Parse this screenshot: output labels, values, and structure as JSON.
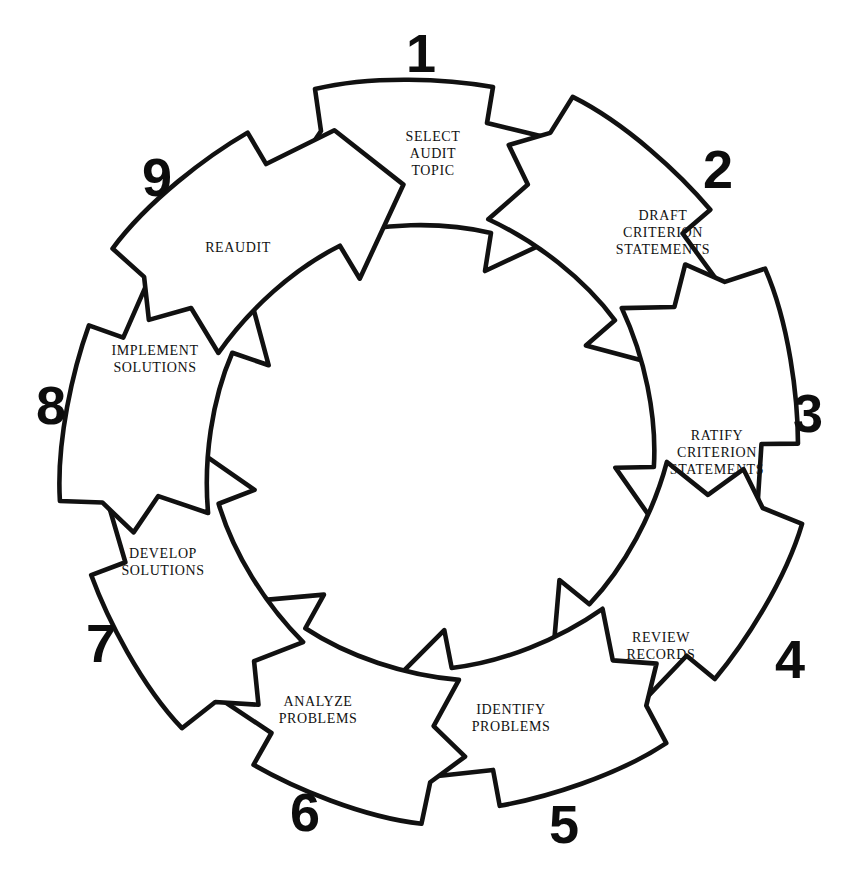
{
  "diagram": {
    "type": "circular-process",
    "direction": "clockwise",
    "step_count": 9,
    "background_color": "#ffffff",
    "stroke_color": "#111111",
    "steps": [
      {
        "number": "1",
        "label_lines": [
          "SELECT",
          "AUDIT",
          "TOPIC"
        ],
        "line1": "SELECT",
        "line2": "AUDIT",
        "line3": "TOPIC",
        "angle_deg": 0,
        "number_x": 421,
        "number_y": 72,
        "label_x": 433,
        "label_y": 158
      },
      {
        "number": "2",
        "label_lines": [
          "DRAFT",
          "CRITERION",
          "STATEMENTS"
        ],
        "line1": "DRAFT",
        "line2": "CRITERION",
        "line3": "STATEMENTS",
        "angle_deg": 40,
        "number_x": 718,
        "number_y": 188,
        "label_x": 663,
        "label_y": 237
      },
      {
        "number": "3",
        "label_lines": [
          "RATIFY",
          "CRITERION",
          "STATEMENTS"
        ],
        "line1": "RATIFY",
        "line2": "CRITERION",
        "line3": "STATEMENTS",
        "angle_deg": 80,
        "number_x": 808,
        "number_y": 432,
        "label_x": 717,
        "label_y": 457
      },
      {
        "number": "4",
        "label_lines": [
          "REVIEW",
          "RECORDS"
        ],
        "line1": "REVIEW",
        "line2": "RECORDS",
        "line3": "",
        "angle_deg": 120,
        "number_x": 790,
        "number_y": 678,
        "label_x": 661,
        "label_y": 650
      },
      {
        "number": "5",
        "label_lines": [
          "IDENTIFY",
          "PROBLEMS"
        ],
        "line1": "IDENTIFY",
        "line2": "PROBLEMS",
        "line3": "",
        "angle_deg": 160,
        "number_x": 564,
        "number_y": 843,
        "label_x": 511,
        "label_y": 722
      },
      {
        "number": "6",
        "label_lines": [
          "ANALYZE",
          "PROBLEMS"
        ],
        "line1": "ANALYZE",
        "line2": "PROBLEMS",
        "line3": "",
        "angle_deg": 200,
        "number_x": 305,
        "number_y": 831,
        "label_x": 318,
        "label_y": 714
      },
      {
        "number": "7",
        "label_lines": [
          "DEVELOP",
          "SOLUTIONS"
        ],
        "line1": "DEVELOP",
        "line2": "SOLUTIONS",
        "line3": "",
        "angle_deg": 240,
        "number_x": 101,
        "number_y": 662,
        "label_x": 163,
        "label_y": 566
      },
      {
        "number": "8",
        "label_lines": [
          "IMPLEMENT",
          "SOLUTIONS"
        ],
        "line1": "IMPLEMENT",
        "line2": "SOLUTIONS",
        "line3": "",
        "angle_deg": 280,
        "number_x": 51,
        "number_y": 424,
        "label_x": 155,
        "label_y": 363
      },
      {
        "number": "9",
        "label_lines": [
          "REAUDIT"
        ],
        "line1": "REAUDIT",
        "line2": "",
        "line3": "",
        "angle_deg": 320,
        "number_x": 157,
        "number_y": 196,
        "label_x": 238,
        "label_y": 252
      }
    ]
  }
}
